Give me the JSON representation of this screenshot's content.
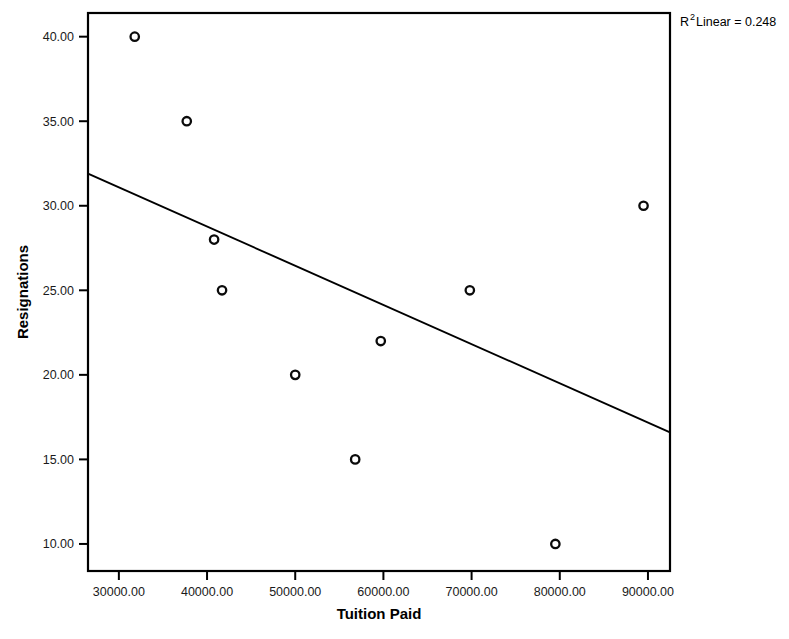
{
  "chart_data": {
    "type": "scatter",
    "title": "",
    "xlabel": "Tuition Paid",
    "ylabel": "Resignations",
    "xlim": [
      26500,
      92500
    ],
    "ylim": [
      8.4,
      41.4
    ],
    "grid": false,
    "legend": "none",
    "x_ticks": [
      30000,
      40000,
      50000,
      60000,
      70000,
      80000,
      90000
    ],
    "y_ticks": [
      10,
      15,
      20,
      25,
      30,
      35,
      40
    ],
    "x_tick_labels": [
      "30000.00",
      "40000.00",
      "50000.00",
      "60000.00",
      "70000.00",
      "80000.00",
      "90000.00"
    ],
    "y_tick_labels": [
      "10.00",
      "15.00",
      "20.00",
      "25.00",
      "30.00",
      "35.00",
      "40.00"
    ],
    "points": [
      {
        "x": 31800,
        "y": 40
      },
      {
        "x": 37700,
        "y": 35
      },
      {
        "x": 40800,
        "y": 28
      },
      {
        "x": 41700,
        "y": 25
      },
      {
        "x": 50000,
        "y": 20
      },
      {
        "x": 56800,
        "y": 15
      },
      {
        "x": 59700,
        "y": 22
      },
      {
        "x": 69800,
        "y": 25
      },
      {
        "x": 79500,
        "y": 10
      },
      {
        "x": 89500,
        "y": 30
      }
    ],
    "fit_line": {
      "x_start": 26500,
      "y_start": 31.9,
      "x_end": 92500,
      "y_end": 16.6
    },
    "annotation": {
      "r_symbol": "R",
      "superscript": "2",
      "text": " Linear = 0.248",
      "full_text": "R2 Linear = 0.248",
      "r_squared": 0.248
    },
    "colors": {
      "axis": "#000000",
      "marker_stroke": "#0b0b0b",
      "marker_fill": "#ffffff",
      "fit_line": "#000000",
      "background": "#ffffff"
    }
  }
}
